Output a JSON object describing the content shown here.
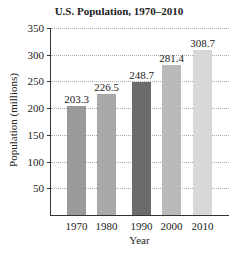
{
  "chart_data": {
    "type": "bar",
    "title": "U.S. Population, 1970–2010",
    "xlabel": "Year",
    "ylabel": "Population (millions)",
    "categories": [
      "1970",
      "1980",
      "1990",
      "2000",
      "2010"
    ],
    "values": [
      203.3,
      226.5,
      248.7,
      281.4,
      308.7
    ],
    "value_labels": [
      "203.3",
      "226.5",
      "248.7",
      "281.4",
      "308.7"
    ],
    "bar_colors": [
      "#9a9a9a",
      "#a9a9a9",
      "#6b6b6b",
      "#bababa",
      "#d8d8d8"
    ],
    "yticks": [
      "50",
      "100",
      "150",
      "200",
      "250",
      "300",
      "350"
    ],
    "ylim": [
      0,
      350
    ],
    "grid": true,
    "legend": null
  }
}
